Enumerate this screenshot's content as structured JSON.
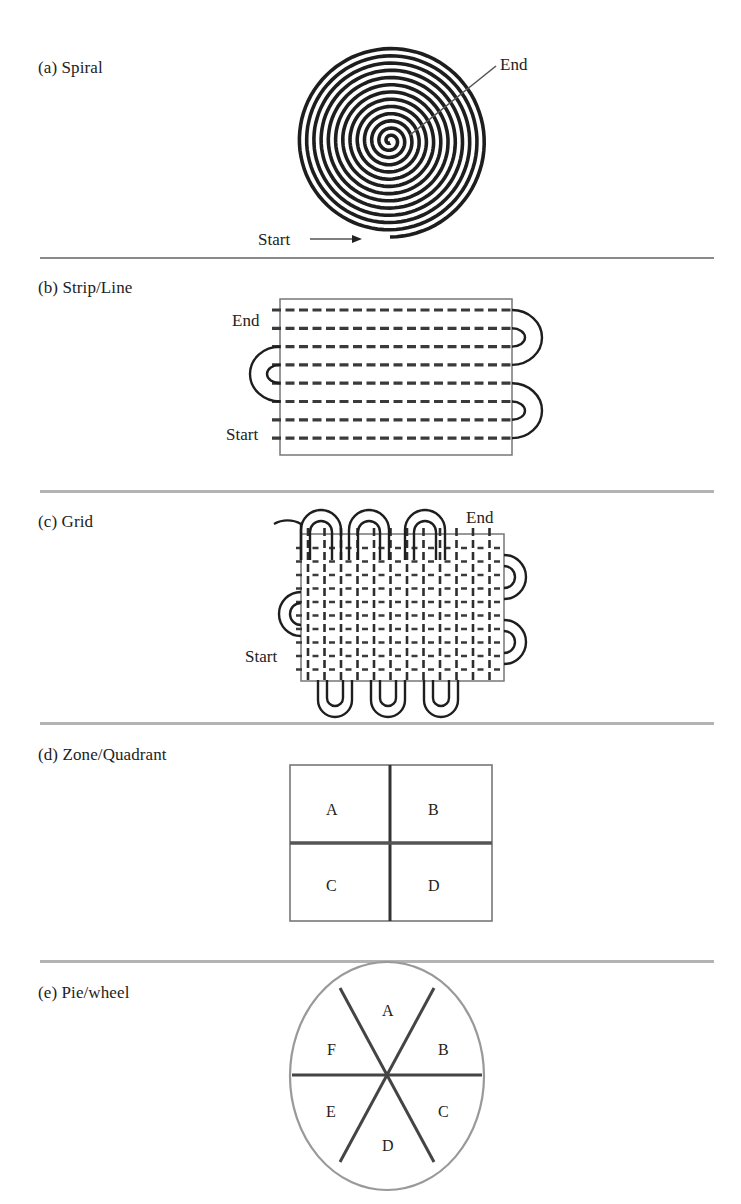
{
  "figure": {
    "panels": [
      {
        "id": "a",
        "label": "(a) Spiral",
        "markers": {
          "end": "End",
          "start": "Start"
        }
      },
      {
        "id": "b",
        "label": "(b) Strip/Line",
        "markers": {
          "end": "End",
          "start": "Start"
        },
        "rows": 8
      },
      {
        "id": "c",
        "label": "(c) Grid",
        "markers": {
          "end": "End",
          "start": "Start"
        }
      },
      {
        "id": "d",
        "label": "(d) Zone/Quadrant",
        "cells": [
          "A",
          "B",
          "C",
          "D"
        ]
      },
      {
        "id": "e",
        "label": "(e) Pie/wheel",
        "sectors": [
          "A",
          "B",
          "C",
          "D",
          "E",
          "F"
        ]
      }
    ]
  },
  "colors": {
    "stroke": "#1e1e1e",
    "divider": "#8a8a8a",
    "box": "#777777"
  }
}
